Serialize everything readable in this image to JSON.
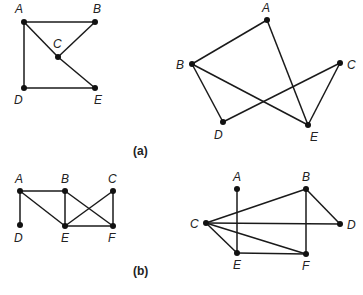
{
  "captions": {
    "a": "(a)",
    "b": "(b)"
  },
  "graphs": [
    {
      "id": "a-left",
      "vertices": [
        {
          "name": "A",
          "x": 24,
          "y": 22,
          "lx": 15,
          "ly": 13
        },
        {
          "name": "B",
          "x": 95,
          "y": 22,
          "lx": 93,
          "ly": 13
        },
        {
          "name": "C",
          "x": 58,
          "y": 57,
          "lx": 53,
          "ly": 48
        },
        {
          "name": "D",
          "x": 24,
          "y": 88,
          "lx": 14,
          "ly": 104
        },
        {
          "name": "E",
          "x": 95,
          "y": 88,
          "lx": 94,
          "ly": 104
        }
      ],
      "edges": [
        [
          "A",
          "B"
        ],
        [
          "A",
          "D"
        ],
        [
          "A",
          "C"
        ],
        [
          "C",
          "B"
        ],
        [
          "C",
          "E"
        ],
        [
          "D",
          "E"
        ]
      ]
    },
    {
      "id": "a-right",
      "vertices": [
        {
          "name": "A",
          "x": 267,
          "y": 20,
          "lx": 262,
          "ly": 12
        },
        {
          "name": "B",
          "x": 192,
          "y": 64,
          "lx": 176,
          "ly": 69
        },
        {
          "name": "C",
          "x": 340,
          "y": 63,
          "lx": 347,
          "ly": 69
        },
        {
          "name": "D",
          "x": 223,
          "y": 122,
          "lx": 214,
          "ly": 139
        },
        {
          "name": "E",
          "x": 308,
          "y": 125,
          "lx": 310,
          "ly": 141
        }
      ],
      "edges": [
        [
          "A",
          "B"
        ],
        [
          "A",
          "E"
        ],
        [
          "B",
          "D"
        ],
        [
          "B",
          "E"
        ],
        [
          "D",
          "C"
        ],
        [
          "C",
          "E"
        ]
      ]
    },
    {
      "id": "b-left",
      "vertices": [
        {
          "name": "A",
          "x": 20,
          "y": 191,
          "lx": 15,
          "ly": 183
        },
        {
          "name": "B",
          "x": 65,
          "y": 191,
          "lx": 61,
          "ly": 183
        },
        {
          "name": "C",
          "x": 113,
          "y": 191,
          "lx": 108,
          "ly": 183
        },
        {
          "name": "D",
          "x": 20,
          "y": 225,
          "lx": 14,
          "ly": 242
        },
        {
          "name": "E",
          "x": 65,
          "y": 226,
          "lx": 61,
          "ly": 242
        },
        {
          "name": "F",
          "x": 113,
          "y": 226,
          "lx": 108,
          "ly": 242
        }
      ],
      "edges": [
        [
          "A",
          "B"
        ],
        [
          "A",
          "D"
        ],
        [
          "A",
          "E"
        ],
        [
          "B",
          "E"
        ],
        [
          "B",
          "F"
        ],
        [
          "C",
          "E"
        ],
        [
          "C",
          "F"
        ],
        [
          "E",
          "F"
        ]
      ]
    },
    {
      "id": "b-right",
      "vertices": [
        {
          "name": "A",
          "x": 237,
          "y": 189,
          "lx": 233,
          "ly": 181
        },
        {
          "name": "B",
          "x": 306,
          "y": 189,
          "lx": 302,
          "ly": 181
        },
        {
          "name": "C",
          "x": 206,
          "y": 223,
          "lx": 190,
          "ly": 228
        },
        {
          "name": "D",
          "x": 340,
          "y": 224,
          "lx": 347,
          "ly": 229
        },
        {
          "name": "E",
          "x": 237,
          "y": 253,
          "lx": 233,
          "ly": 269
        },
        {
          "name": "F",
          "x": 306,
          "y": 254,
          "lx": 302,
          "ly": 270
        }
      ],
      "edges": [
        [
          "A",
          "E"
        ],
        [
          "C",
          "B"
        ],
        [
          "C",
          "D"
        ],
        [
          "C",
          "E"
        ],
        [
          "C",
          "F"
        ],
        [
          "B",
          "D"
        ],
        [
          "B",
          "F"
        ],
        [
          "E",
          "F"
        ]
      ]
    }
  ]
}
